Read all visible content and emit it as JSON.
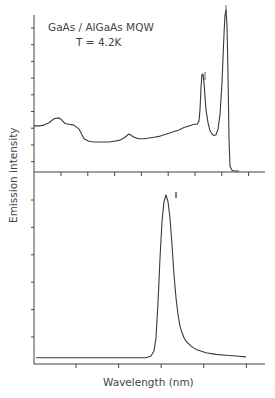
{
  "chart_data": [
    {
      "type": "line",
      "panel": "top",
      "title": "",
      "annotations": [
        "GaAs / AlGaAs MQW",
        "T = 4.2K"
      ],
      "xlabel": "",
      "ylabel": "Emission intensity",
      "x_ticks_count": 8,
      "y_ticks_count": 9,
      "grid": false,
      "x": [
        0,
        5,
        10,
        15,
        20,
        25,
        28,
        31,
        35,
        40,
        45,
        50,
        55,
        60,
        65,
        70,
        75,
        80,
        85,
        90,
        95,
        100,
        105,
        110,
        115,
        120,
        125,
        130,
        135,
        140,
        145,
        150,
        155,
        160,
        163,
        165,
        166,
        167,
        168,
        169,
        170,
        171,
        172,
        174,
        176,
        178,
        180,
        182,
        184,
        186,
        188,
        189,
        190,
        191,
        192,
        193,
        194,
        195,
        196,
        198,
        200,
        205
      ],
      "values": [
        28,
        28,
        28.5,
        30,
        32.5,
        33,
        31.5,
        29.5,
        29,
        28.5,
        26,
        20,
        18.5,
        18,
        18,
        18,
        18,
        18.5,
        19,
        20.5,
        23,
        21,
        20,
        20,
        20.5,
        21,
        21.5,
        22.5,
        23.5,
        24.5,
        25.5,
        27,
        28,
        29,
        29,
        31,
        38,
        52,
        60,
        60,
        55,
        46,
        38,
        30,
        25,
        23,
        22,
        22.5,
        26,
        35,
        55,
        70,
        85,
        97,
        100,
        90,
        60,
        20,
        3,
        0.5,
        0,
        0
      ],
      "xlim": [
        0,
        205
      ],
      "ylim": [
        0,
        100
      ],
      "peaks": [
        {
          "label": "main peak",
          "x": 192,
          "y": 100
        },
        {
          "label": "secondary peak",
          "x": 168,
          "y": 60
        },
        {
          "label": "small bump",
          "x": 25,
          "y": 33
        },
        {
          "label": "small bump",
          "x": 90,
          "y": 23
        }
      ]
    },
    {
      "type": "line",
      "panel": "bottom",
      "title": "",
      "xlabel": "Wavelength (nm)",
      "ylabel": "Emission intensity",
      "x_ticks_count": 5,
      "y_ticks_count": 6,
      "grid": false,
      "x": [
        0,
        20,
        40,
        60,
        80,
        100,
        110,
        115,
        118,
        120,
        122,
        124,
        126,
        128,
        130,
        132,
        134,
        136,
        138,
        140,
        142,
        144,
        146,
        148,
        150,
        155,
        160,
        170,
        180,
        190,
        200,
        210
      ],
      "values": [
        2,
        2,
        2,
        2,
        2,
        2,
        2,
        3,
        6,
        14,
        35,
        62,
        84,
        96,
        100,
        96,
        86,
        70,
        52,
        38,
        28,
        21,
        17,
        14,
        12,
        9,
        7,
        5,
        4,
        3.5,
        3,
        2.5
      ],
      "xlim": [
        0,
        220
      ],
      "ylim": [
        0,
        100
      ],
      "peaks": [
        {
          "label": "single emission peak",
          "x": 130,
          "y": 100
        }
      ]
    }
  ],
  "labels": {
    "annotation_line1": "GaAs / AlGaAs MQW",
    "annotation_line2": "T = 4.2K",
    "y_axis": "Emission intensity",
    "x_axis": "Wavelength (nm)"
  },
  "colors": {
    "line": "#3a3a3a",
    "axis": "#444444",
    "background": "#ffffff"
  }
}
